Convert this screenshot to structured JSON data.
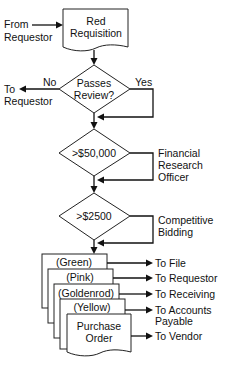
{
  "diagram": {
    "colors": {
      "stroke": "#222222",
      "fill": "#ffffff",
      "text": "#111111"
    },
    "inputs": {
      "from_requestor_line1": "From",
      "from_requestor_line2": "Requestor"
    },
    "start_document": {
      "line1": "Red",
      "line2": "Requisition"
    },
    "decisions": [
      {
        "label_line1": "Passes",
        "label_line2": "Review?",
        "no_label": "No",
        "yes_label": "Yes",
        "no_target_line1": "To",
        "no_target_line2": "Requestor"
      },
      {
        "label_line1": ">$50,000",
        "side_line1": "Financial",
        "side_line2": "Research",
        "side_line3": "Officer"
      },
      {
        "label_line1": ">$2500",
        "side_line1": "Competitive",
        "side_line2": "Bidding"
      }
    ],
    "copies": [
      {
        "label": "(Green)",
        "destination": "To File"
      },
      {
        "label": "(Pink)",
        "destination": "To Requestor"
      },
      {
        "label": "(Goldenrod)",
        "destination": "To Receiving"
      },
      {
        "label": "(Yellow)",
        "destination_line1": "To Accounts",
        "destination_line2": "Payable"
      },
      {
        "label_line1": "Purchase",
        "label_line2": "Order",
        "destination": "To Vendor"
      }
    ]
  }
}
